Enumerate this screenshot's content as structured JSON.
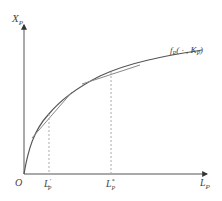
{
  "diagram": {
    "y_axis": {
      "label": "X",
      "subscript": "P"
    },
    "x_axis": {
      "label": "L",
      "subscript": "P"
    },
    "origin": {
      "label": "O"
    },
    "curve": {
      "label_f": "f",
      "label_sub": "P",
      "label_args": "( · , K",
      "label_k_sub": "P",
      "label_close": ")"
    },
    "markers": [
      {
        "label": "L",
        "subscript": "P",
        "superscript": "'"
      },
      {
        "label": "L",
        "subscript": "P",
        "superscript": "*"
      }
    ],
    "colors": {
      "axis": "#555555",
      "curve": "#555555",
      "tangent": "#888888",
      "guide": "#aaaaaa",
      "text": "#444444"
    }
  }
}
